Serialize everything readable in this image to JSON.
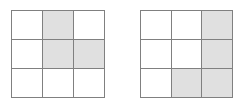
{
  "figure": {
    "background_color": "#ffffff",
    "line_color": "#808080",
    "shaded_color": "#e0e0e0",
    "empty_color": "#ffffff",
    "rows": 3,
    "columns": 3,
    "grids": [
      {
        "name": "left-grid",
        "label": "",
        "shaded_count": 3,
        "cells": [
          [
            {
              "state": "empty",
              "label": ""
            },
            {
              "state": "shaded",
              "label": ""
            },
            {
              "state": "empty",
              "label": ""
            }
          ],
          [
            {
              "state": "empty",
              "label": ""
            },
            {
              "state": "shaded",
              "label": ""
            },
            {
              "state": "shaded",
              "label": ""
            }
          ],
          [
            {
              "state": "empty",
              "label": ""
            },
            {
              "state": "empty",
              "label": ""
            },
            {
              "state": "empty",
              "label": ""
            }
          ]
        ]
      },
      {
        "name": "right-grid",
        "label": "",
        "shaded_count": 4,
        "cells": [
          [
            {
              "state": "empty",
              "label": ""
            },
            {
              "state": "empty",
              "label": ""
            },
            {
              "state": "shaded",
              "label": ""
            }
          ],
          [
            {
              "state": "empty",
              "label": ""
            },
            {
              "state": "empty",
              "label": ""
            },
            {
              "state": "shaded",
              "label": ""
            }
          ],
          [
            {
              "state": "empty",
              "label": ""
            },
            {
              "state": "shaded",
              "label": ""
            },
            {
              "state": "shaded",
              "label": ""
            }
          ]
        ]
      }
    ]
  }
}
